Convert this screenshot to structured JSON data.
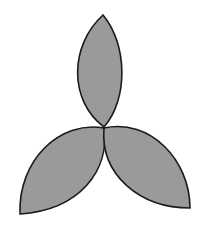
{
  "figure": {
    "fill_color": "#9a9a9a",
    "stroke_color": "#1a1a1a",
    "petals": [
      {
        "name": "top-petal"
      },
      {
        "name": "bottom-left-petal"
      },
      {
        "name": "bottom-right-petal"
      }
    ]
  }
}
